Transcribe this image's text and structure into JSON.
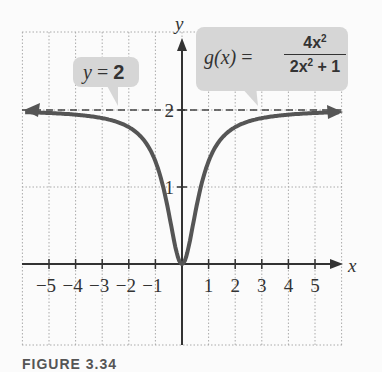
{
  "chart_data": {
    "type": "line",
    "title": "",
    "function": "g(x) = 4x^2 / (2x^2 + 1)",
    "xlabel": "x",
    "ylabel": "y",
    "xlim": [
      -6,
      6
    ],
    "ylim": [
      -1,
      3
    ],
    "x_ticks": [
      -5,
      -4,
      -3,
      -2,
      -1,
      1,
      2,
      3,
      4,
      5
    ],
    "y_ticks": [
      1,
      2
    ],
    "grid": true,
    "series": [
      {
        "name": "g(x)",
        "x": [
          -6,
          -5,
          -4,
          -3,
          -2,
          -1.5,
          -1,
          -0.75,
          -0.5,
          -0.25,
          0,
          0.25,
          0.5,
          0.75,
          1,
          1.5,
          2,
          3,
          4,
          5,
          6
        ],
        "values": [
          1.973,
          1.961,
          1.939,
          1.895,
          1.778,
          1.636,
          1.333,
          1.059,
          0.667,
          0.222,
          0,
          0.222,
          0.667,
          1.059,
          1.333,
          1.636,
          1.778,
          1.895,
          1.939,
          1.961,
          1.973
        ]
      }
    ],
    "asymptote": {
      "type": "horizontal",
      "y": 2,
      "style": "dashed"
    },
    "annotations": [
      {
        "text": "y = 2",
        "target": "horizontal asymptote"
      },
      {
        "text": "g(x) = 4x^2 / (2x^2 + 1)",
        "target": "curve"
      }
    ]
  },
  "labels": {
    "x_axis": "x",
    "y_axis": "y",
    "x_ticks": [
      "−5",
      "−4",
      "−3",
      "−2",
      "−1",
      "1",
      "2",
      "3",
      "4",
      "5"
    ],
    "y_ticks": [
      "1",
      "2"
    ],
    "asymptote_callout": {
      "lhs": "y",
      "eq": "=",
      "rhs": "2"
    },
    "function_callout": {
      "name": "g(x)",
      "eq": "=",
      "numerator": "4x",
      "num_exp": "2",
      "denominator": "2x",
      "den_exp": "2",
      "den_tail": "+ 1"
    },
    "caption": "FIGURE 3.34"
  }
}
